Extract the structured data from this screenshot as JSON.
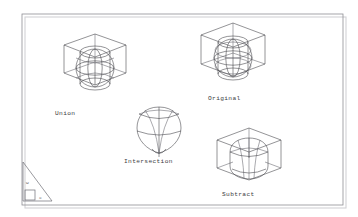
{
  "document": {
    "title": "Boolean Solid Operations",
    "background_color": "#ffffff",
    "line_color": "#3a3a40",
    "frame_color": "#8e8e94"
  },
  "frame": {
    "name": "drawing-border",
    "x": 22,
    "y": 14,
    "width": 321,
    "height": 191
  },
  "figures": [
    {
      "id": "union",
      "label": "Union",
      "label_x": 55,
      "label_y": 115,
      "center_x": 95,
      "center_y": 66,
      "description": "wireframe box with sphere and cylinder unioned"
    },
    {
      "id": "original",
      "label": "Original",
      "label_x": 208,
      "label_y": 100,
      "center_x": 233,
      "center_y": 56,
      "description": "wireframe box, sphere and cylinder shown separately"
    },
    {
      "id": "intersection",
      "label": "Intersection",
      "label_x": 124,
      "label_y": 163,
      "center_x": 159,
      "center_y": 126,
      "description": "teardrop shaped intersection solid"
    },
    {
      "id": "subtract",
      "label": "Subtract",
      "label_x": 222,
      "label_y": 196,
      "center_x": 249,
      "center_y": 158,
      "description": "wireframe box with sphere and cylinder subtracted"
    }
  ],
  "ucs_icon": {
    "name": "wcs-coordinate-icon",
    "w_label": "W",
    "x_label": "X",
    "origin_x": 23,
    "origin_y": 199
  }
}
